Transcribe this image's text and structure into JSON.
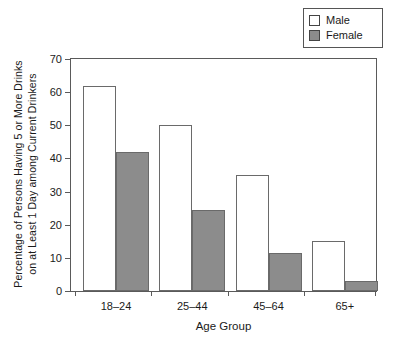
{
  "chart_data": {
    "type": "bar",
    "title": "",
    "categories": [
      "18–24",
      "25–44",
      "45–64",
      "65+"
    ],
    "series": [
      {
        "name": "Male",
        "color": "#ffffff",
        "values": [
          62,
          50,
          35,
          15
        ]
      },
      {
        "name": "Female",
        "color": "#8c8c8c",
        "values": [
          42,
          24.3,
          11.5,
          3
        ]
      }
    ],
    "xlabel": "Age Group",
    "ylabel_lines": [
      "Percentage of Persons Having 5 or More Drinks",
      "on at Least 1 Day among Current Drinkers"
    ],
    "ylim": [
      0,
      70
    ],
    "ytick_values": [
      0,
      10,
      20,
      30,
      40,
      50,
      60,
      70
    ],
    "ytick_labels": [
      "0",
      "10",
      "20",
      "30",
      "40",
      "50",
      "60",
      "70"
    ],
    "grid": false,
    "legend_position": "top-right"
  },
  "legend": {
    "entries": [
      {
        "label": "Male",
        "swatch": "legend-swatch-male"
      },
      {
        "label": "Female",
        "swatch": "legend-swatch-female"
      }
    ]
  }
}
